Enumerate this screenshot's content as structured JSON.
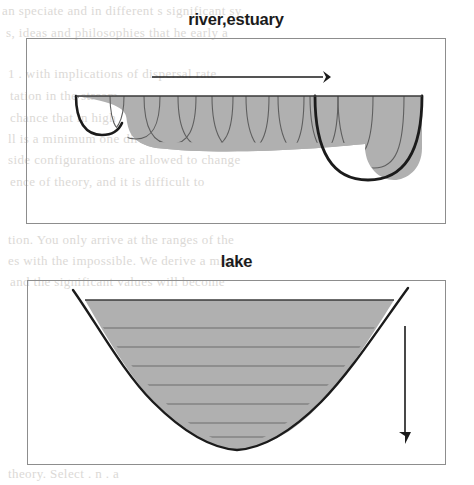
{
  "figure": {
    "kind": "scientific-figure",
    "medium": "scanned book page",
    "paper_color": "#ffffff",
    "ink_color": "#1b1b1b",
    "frame_color": "#8d8d8d",
    "water_fill_color": "#b0b0b0",
    "water_fill_color_dark": "#a3a3a3",
    "section_line_color": "#6d6d6d"
  },
  "panels": [
    {
      "id": "river-estuary",
      "title": "river,estuary",
      "frame": {
        "x": 26,
        "y": 38,
        "width": 420,
        "height": 186
      },
      "arrow": {
        "name": "flow-direction-arrow",
        "orientation": "horizontal",
        "direction": "right",
        "from_x": 152,
        "from_y": 77,
        "to_x": 331,
        "to_y": 77
      },
      "water_body": {
        "name": "river-channel-longitudinal-section",
        "surface_y": 96,
        "surface_x_start": 76,
        "surface_x_end": 422,
        "bed_y_left": 142,
        "bed_y_right": 168,
        "cross_section_count": 9,
        "description": "wedge-shaped longitudinal profile deepening downstream with nested U cross-sections"
      }
    },
    {
      "id": "lake",
      "title": "lake",
      "frame": {
        "x": 27,
        "y": 280,
        "width": 419,
        "height": 185
      },
      "arrow": {
        "name": "sinking-direction-arrow",
        "orientation": "vertical",
        "direction": "down",
        "from_x": 405,
        "from_y": 326,
        "to_x": 405,
        "to_y": 441
      },
      "water_body": {
        "name": "lake-basin-cross-section",
        "surface_y": 300,
        "surface_x_start": 85,
        "surface_x_end": 394,
        "rim_left_x": 73,
        "rim_left_y": 290,
        "rim_right_x": 408,
        "rim_right_y": 288,
        "bottom_x": 237,
        "bottom_y": 448,
        "stratification_line_count": 7,
        "description": "parabolic basin with horizontal stratification layers"
      }
    }
  ],
  "background_text": [
    {
      "text": "an speciate and in different s      significant sy",
      "x": 2,
      "y": 3,
      "size": 13
    },
    {
      "text": "s, ideas and philosophies that he early a",
      "x": 6,
      "y": 25,
      "size": 13
    },
    {
      "text": "1 . with implications of dispersal rate",
      "x": 8,
      "y": 66,
      "size": 13
    },
    {
      "text": "tation in the stream",
      "x": 10,
      "y": 88,
      "size": 13
    },
    {
      "text": "chance that in high",
      "x": 10,
      "y": 110,
      "size": 13
    },
    {
      "text": "ll is a minimum one directions per unit",
      "x": 8,
      "y": 131,
      "size": 13
    },
    {
      "text": "side configurations are allowed to change",
      "x": 8,
      "y": 152,
      "size": 13
    },
    {
      "text": "ence of theory, and it is difficult to",
      "x": 10,
      "y": 174,
      "size": 13
    },
    {
      "text": "tion. You only arrive at the ranges of the",
      "x": 8,
      "y": 232,
      "size": 13
    },
    {
      "text": "es with the impossible. We derive a minim",
      "x": 8,
      "y": 253,
      "size": 13
    },
    {
      "text": "and the significant values will become",
      "x": 10,
      "y": 274,
      "size": 13
    },
    {
      "text": "theory. Select . n . a",
      "x": 8,
      "y": 466,
      "size": 13
    }
  ]
}
